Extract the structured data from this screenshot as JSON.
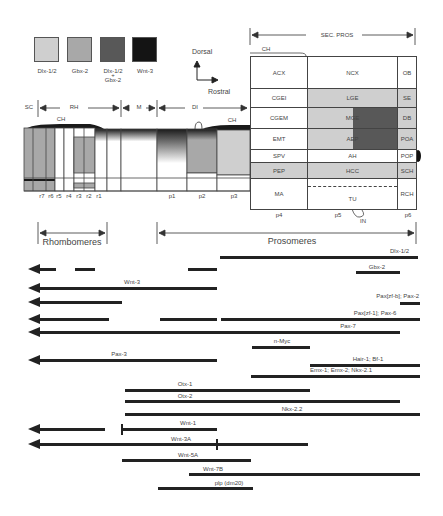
{
  "legend": {
    "items": [
      {
        "label": "Dlx-1/2",
        "color": "#cfcfcf"
      },
      {
        "label": "Gbx-2",
        "color": "#a8a8a8"
      },
      {
        "label": "Dlx-1/2\n+\nGbx-2",
        "label_line1": "Dlx-1/2",
        "label_plus": "+",
        "label_line2": "Gbx-2",
        "color": "#585858"
      },
      {
        "label": "Wnt-3",
        "color": "#141414"
      }
    ]
  },
  "axes": {
    "dorsal": "Dorsal",
    "rostral": "Rostral"
  },
  "regions_top": {
    "sc": "SC",
    "rh": "RH",
    "m": "M",
    "di": "DI",
    "ch_left": "CH",
    "ch_mid": "CH",
    "ch_right": "CH",
    "sec_pros": "SEC. PROS"
  },
  "grid": {
    "col_p4": [
      "ACX",
      "CGEI",
      "CGEM",
      "EMT",
      "SPV",
      "PEP",
      "MA"
    ],
    "col_p5": [
      "NCX",
      "LGE",
      "MGE",
      "AEP",
      "AH",
      "HCC",
      "TU"
    ],
    "col_p6": [
      "OB",
      "SE",
      "DB",
      "POA",
      "POP",
      "SCH",
      "RCH"
    ],
    "in_label": "IN"
  },
  "segments": {
    "rhombomeres": [
      "r7",
      "r6",
      "r5",
      "r4",
      "r3",
      "r2",
      "r1"
    ],
    "prosomeres": [
      "p1",
      "p2",
      "p3",
      "p4",
      "p5",
      "p6"
    ]
  },
  "spans": {
    "rhombomeres": "Rhombomeres",
    "prosomeres": "Prosomeres"
  },
  "genes": [
    {
      "label": "Dlx-1/2"
    },
    {
      "label": "Gbx-2"
    },
    {
      "label": "Wnt-3"
    },
    {
      "label": "Pax[zf-b]; Pax-2"
    },
    {
      "label": "Pax[zf-1]; Pax-6"
    },
    {
      "label": "Pax-7"
    },
    {
      "label": "n-Myc"
    },
    {
      "label": "Pax-3"
    },
    {
      "label": "Hair-1; Bf-1"
    },
    {
      "label": "Emx-1; Emx-2; Nkx-2.1"
    },
    {
      "label": "Otx-1"
    },
    {
      "label": "Otx-2"
    },
    {
      "label": "Nkx-2.2"
    },
    {
      "label": "Wnt-1"
    },
    {
      "label": "Wnt-3A"
    },
    {
      "label": "Wnt-5A"
    },
    {
      "label": "Wnt-7B"
    },
    {
      "label": "plp (dm20)"
    }
  ]
}
